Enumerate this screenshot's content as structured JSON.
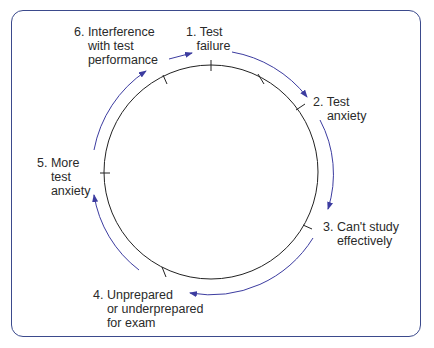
{
  "diagram": {
    "type": "cycle",
    "colors": {
      "circle": "#222222",
      "arrows": "#3c3ca0",
      "frame": "#3b4a8c"
    },
    "steps": [
      {
        "id": "1",
        "label": "1. Test\n   failure"
      },
      {
        "id": "2",
        "label": "2. Test\n    anxiety"
      },
      {
        "id": "3",
        "label": "3. Can't study\n    effectively"
      },
      {
        "id": "4",
        "label": "4. Unprepared\n    or underprepared\n    for exam"
      },
      {
        "id": "5",
        "label": "5. More\n    test\n    anxiety"
      },
      {
        "id": "6",
        "label": "6. Interference\n    with test\n    performance"
      }
    ]
  }
}
